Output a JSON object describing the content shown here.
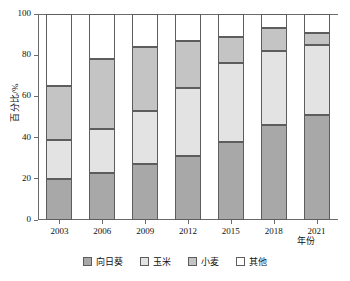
{
  "chart_data": {
    "type": "bar",
    "stacked": true,
    "title": "",
    "xlabel": "年份",
    "ylabel": "百分比/%",
    "categories": [
      "2003",
      "2006",
      "2009",
      "2012",
      "2015",
      "2018",
      "2021"
    ],
    "ylim": [
      0,
      100
    ],
    "ytick_labels": [
      "0",
      "20",
      "40",
      "60",
      "80",
      "100"
    ],
    "ytick_values": [
      0,
      20,
      40,
      60,
      80,
      100
    ],
    "grid": false,
    "legend_position": "bottom",
    "series": [
      {
        "name": "向日葵",
        "color": "#a8a8a8",
        "values": [
          20,
          23,
          27,
          31,
          38,
          46,
          51
        ]
      },
      {
        "name": "玉米",
        "color": "#e3e3e3",
        "values": [
          19,
          21,
          26,
          33,
          38,
          36,
          34
        ]
      },
      {
        "name": "小麦",
        "color": "#c4c4c4",
        "values": [
          26,
          34,
          31,
          23,
          13,
          11,
          6
        ]
      },
      {
        "name": "其他",
        "color": "#ffffff",
        "values": [
          35,
          22,
          16,
          13,
          11,
          7,
          9
        ]
      }
    ],
    "cumulative_tops": {
      "向日葵": [
        20,
        23,
        27,
        31,
        38,
        46,
        51
      ],
      "玉米": [
        39,
        44,
        53,
        64,
        76,
        82,
        85
      ],
      "小麦": [
        65,
        78,
        84,
        87,
        89,
        93,
        91
      ],
      "其他": [
        100,
        100,
        100,
        100,
        100,
        100,
        100
      ]
    }
  },
  "legend": {
    "items": [
      {
        "label": "向日葵",
        "color": "#a8a8a8"
      },
      {
        "label": "玉米",
        "color": "#e3e3e3"
      },
      {
        "label": "小麦",
        "color": "#c4c4c4"
      },
      {
        "label": "其他",
        "color": "#ffffff"
      }
    ]
  },
  "axes": {
    "y_title": "百分比/%",
    "x_title": "年份"
  },
  "colors": {
    "axis": "#6b6b6b",
    "segment_border": "#5d5d5d",
    "text": "#111111",
    "background": "#ffffff"
  }
}
